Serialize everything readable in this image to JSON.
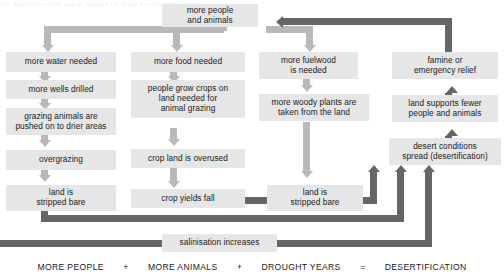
{
  "diagram": {
    "ghost_caption": "the desertification spiral caused by more people and animals",
    "colors": {
      "node_fill": "#e6e6e6",
      "light_connector": "#b9b9b9",
      "dark_connector": "#666666",
      "text": "#1a1a1a",
      "background": "#ffffff"
    },
    "nodes": [
      {
        "id": "more-people-and-animals",
        "label": "more people\nand animals"
      },
      {
        "id": "more-water-needed",
        "label": "more water needed"
      },
      {
        "id": "more-wells-drilled",
        "label": "more wells drilled"
      },
      {
        "id": "grazing-animals-pushed",
        "label": "grazing animals are\npushed on to drier areas"
      },
      {
        "id": "overgrazing",
        "label": "overgrazing"
      },
      {
        "id": "land-is-stripped-bare-left",
        "label": "land is\nstripped bare"
      },
      {
        "id": "more-food-needed",
        "label": "more food needed"
      },
      {
        "id": "people-grow-crops",
        "label": "people grow crops on\nland needed for\nanimal grazing"
      },
      {
        "id": "crop-land-is-overused",
        "label": "crop land is overused"
      },
      {
        "id": "crop-yields-fall",
        "label": "crop yields fall"
      },
      {
        "id": "more-fuelwood-is-needed",
        "label": "more fuelwood\nis needed"
      },
      {
        "id": "more-woody-plants-taken",
        "label": "more woody plants are\ntaken from the land"
      },
      {
        "id": "land-is-stripped-bare-right",
        "label": "land is\nstripped bare"
      },
      {
        "id": "famine-or-emergency-relief",
        "label": "famine or\nemergency relief"
      },
      {
        "id": "land-supports-fewer",
        "label": "land supports fewer\npeople and animals"
      },
      {
        "id": "desert-conditions-spread",
        "label": "desert conditions\nspread (desertification)"
      },
      {
        "id": "salinisation-increases",
        "label": "salinisation increases"
      }
    ]
  },
  "equation": {
    "terms": [
      {
        "id": "more-people",
        "label": "MORE PEOPLE"
      },
      {
        "id": "more-animals",
        "label": "MORE ANIMALS"
      },
      {
        "id": "drought-years",
        "label": "DROUGHT YEARS"
      },
      {
        "id": "desertification",
        "label": "DESERTIFICATION"
      }
    ],
    "operators": [
      {
        "id": "plus-1",
        "label": "+"
      },
      {
        "id": "plus-2",
        "label": "+"
      },
      {
        "id": "equals",
        "label": "="
      }
    ]
  }
}
